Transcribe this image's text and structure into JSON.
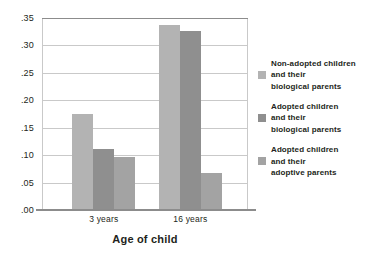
{
  "chart_data": {
    "type": "bar",
    "title": "",
    "xlabel": "Age of child",
    "ylabel": "",
    "categories": [
      "3 years",
      "16 years"
    ],
    "ylim": [
      0.0,
      0.35
    ],
    "yticks": [
      0.0,
      0.05,
      0.1,
      0.15,
      0.2,
      0.25,
      0.3,
      0.35
    ],
    "ytick_labels": [
      ".00",
      ".05",
      ".10",
      ".15",
      ".20",
      ".25",
      ".30",
      ".35"
    ],
    "grid": true,
    "legend_position": "right",
    "series": [
      {
        "name": "Non-adopted children and their biological parents",
        "legend_label": "Non-adopted children\nand their\nbiological parents",
        "color": "#b3b3b3",
        "values": [
          0.175,
          0.337
        ]
      },
      {
        "name": "Adopted children and their biological parents",
        "legend_label": "Adopted children\nand their\nbiological parents",
        "color": "#8f8f8f",
        "values": [
          0.111,
          0.327
        ]
      },
      {
        "name": "Adopted children and their adoptive parents",
        "legend_label": "Adopted children\nand  their\nadoptive parents",
        "color": "#a3a3a3",
        "values": [
          0.097,
          0.068
        ]
      }
    ]
  },
  "axis": {
    "y_labels": [
      ".35",
      ".30",
      ".25",
      ".20",
      ".15",
      ".10",
      ".05",
      ".00"
    ],
    "x_labels": [
      "3 years",
      "16 years"
    ],
    "x_title": "Age of child"
  },
  "legend": {
    "entries": [
      {
        "label": "Non-adopted children\nand their\nbiological parents",
        "color": "#b3b3b3"
      },
      {
        "label": "Adopted children\nand their\nbiological parents",
        "color": "#8f8f8f"
      },
      {
        "label": "Adopted children\nand  their\nadoptive parents",
        "color": "#a3a3a3"
      }
    ]
  },
  "colors": {
    "grid": "#c9c9c9",
    "axis": "#8c8c8c",
    "text": "#231f20",
    "background": "#ffffff"
  }
}
